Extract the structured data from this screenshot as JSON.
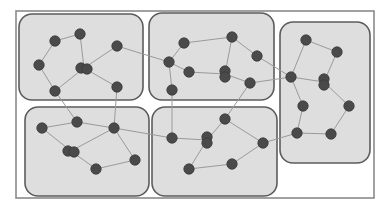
{
  "diagram": {
    "type": "clustered-network-graph",
    "colors": {
      "background": "#ffffff",
      "frame_stroke": "#8a8a8a",
      "cluster_fill": "#dedede",
      "cluster_stroke": "#5c5c5c",
      "edge": "#9a9a9a",
      "node": "#4a4a4a"
    },
    "frame": {
      "x": 16,
      "y": 11,
      "w": 358,
      "h": 187
    },
    "clusters": [
      {
        "id": "top-left",
        "x": 19,
        "y": 14,
        "w": 124,
        "h": 86,
        "r": 13
      },
      {
        "id": "top-middle",
        "x": 149,
        "y": 13,
        "w": 125,
        "h": 87,
        "r": 13
      },
      {
        "id": "right",
        "x": 280,
        "y": 22,
        "w": 90,
        "h": 141,
        "r": 13
      },
      {
        "id": "bottom-left",
        "x": 25,
        "y": 107,
        "w": 124,
        "h": 89,
        "r": 13
      },
      {
        "id": "bottom-middle",
        "x": 152,
        "y": 107,
        "w": 125,
        "h": 89,
        "r": 13
      }
    ],
    "nodes": [
      {
        "id": "A",
        "cluster": "top-left",
        "x": 55,
        "y": 41,
        "shape": "circle"
      },
      {
        "id": "B",
        "cluster": "top-left",
        "x": 80,
        "y": 34,
        "shape": "circle"
      },
      {
        "id": "C",
        "cluster": "top-left",
        "x": 39,
        "y": 65,
        "shape": "circle"
      },
      {
        "id": "D",
        "cluster": "top-left",
        "x": 84,
        "y": 68,
        "shape": "double-h"
      },
      {
        "id": "E",
        "cluster": "top-left",
        "x": 117,
        "y": 46,
        "shape": "circle"
      },
      {
        "id": "F",
        "cluster": "top-left",
        "x": 55,
        "y": 91,
        "shape": "circle"
      },
      {
        "id": "G",
        "cluster": "top-left",
        "x": 117,
        "y": 87,
        "shape": "circle"
      },
      {
        "id": "H",
        "cluster": "top-middle",
        "x": 169,
        "y": 62,
        "shape": "circle"
      },
      {
        "id": "I",
        "cluster": "top-middle",
        "x": 184,
        "y": 43,
        "shape": "circle"
      },
      {
        "id": "J",
        "cluster": "top-middle",
        "x": 232,
        "y": 37,
        "shape": "circle"
      },
      {
        "id": "K",
        "cluster": "top-middle",
        "x": 257,
        "y": 56,
        "shape": "circle"
      },
      {
        "id": "L",
        "cluster": "top-middle",
        "x": 189,
        "y": 72,
        "shape": "circle"
      },
      {
        "id": "M",
        "cluster": "top-middle",
        "x": 225,
        "y": 74,
        "shape": "double-v"
      },
      {
        "id": "N",
        "cluster": "top-middle",
        "x": 250,
        "y": 83,
        "shape": "circle"
      },
      {
        "id": "O",
        "cluster": "top-middle",
        "x": 172,
        "y": 90,
        "shape": "circle"
      },
      {
        "id": "P",
        "cluster": "right",
        "x": 306,
        "y": 40,
        "shape": "circle"
      },
      {
        "id": "Q",
        "cluster": "right",
        "x": 337,
        "y": 52,
        "shape": "circle"
      },
      {
        "id": "R",
        "cluster": "right",
        "x": 291,
        "y": 77,
        "shape": "circle"
      },
      {
        "id": "S",
        "cluster": "right",
        "x": 324,
        "y": 82,
        "shape": "double-v"
      },
      {
        "id": "T",
        "cluster": "right",
        "x": 303,
        "y": 106,
        "shape": "circle"
      },
      {
        "id": "U",
        "cluster": "right",
        "x": 349,
        "y": 106,
        "shape": "circle"
      },
      {
        "id": "V",
        "cluster": "right",
        "x": 297,
        "y": 133,
        "shape": "circle"
      },
      {
        "id": "W",
        "cluster": "right",
        "x": 331,
        "y": 134,
        "shape": "circle"
      },
      {
        "id": "a",
        "cluster": "bottom-left",
        "x": 42,
        "y": 128,
        "shape": "circle"
      },
      {
        "id": "b",
        "cluster": "bottom-left",
        "x": 77,
        "y": 122,
        "shape": "circle"
      },
      {
        "id": "c",
        "cluster": "bottom-left",
        "x": 114,
        "y": 128,
        "shape": "circle"
      },
      {
        "id": "d",
        "cluster": "bottom-left",
        "x": 71,
        "y": 151,
        "shape": "double-h"
      },
      {
        "id": "e",
        "cluster": "bottom-left",
        "x": 135,
        "y": 160,
        "shape": "circle"
      },
      {
        "id": "f",
        "cluster": "bottom-left",
        "x": 96,
        "y": 169,
        "shape": "circle"
      },
      {
        "id": "g",
        "cluster": "bottom-middle",
        "x": 172,
        "y": 138,
        "shape": "circle"
      },
      {
        "id": "h",
        "cluster": "bottom-middle",
        "x": 207,
        "y": 140,
        "shape": "double-v"
      },
      {
        "id": "i",
        "cluster": "bottom-middle",
        "x": 225,
        "y": 119,
        "shape": "circle"
      },
      {
        "id": "j",
        "cluster": "bottom-middle",
        "x": 263,
        "y": 143,
        "shape": "circle"
      },
      {
        "id": "k",
        "cluster": "bottom-middle",
        "x": 232,
        "y": 164,
        "shape": "circle"
      },
      {
        "id": "l",
        "cluster": "bottom-middle",
        "x": 189,
        "y": 169,
        "shape": "circle"
      }
    ],
    "edges": [
      [
        "A",
        "B"
      ],
      [
        "A",
        "C"
      ],
      [
        "B",
        "D"
      ],
      [
        "C",
        "F"
      ],
      [
        "D",
        "E"
      ],
      [
        "D",
        "F"
      ],
      [
        "D",
        "G"
      ],
      [
        "E",
        "H"
      ],
      [
        "H",
        "I"
      ],
      [
        "I",
        "J"
      ],
      [
        "J",
        "M"
      ],
      [
        "H",
        "L"
      ],
      [
        "H",
        "O"
      ],
      [
        "L",
        "M"
      ],
      [
        "M",
        "N"
      ],
      [
        "J",
        "K"
      ],
      [
        "K",
        "R"
      ],
      [
        "P",
        "R"
      ],
      [
        "P",
        "Q"
      ],
      [
        "Q",
        "S"
      ],
      [
        "R",
        "S"
      ],
      [
        "R",
        "T"
      ],
      [
        "S",
        "U"
      ],
      [
        "T",
        "V"
      ],
      [
        "U",
        "W"
      ],
      [
        "V",
        "W"
      ],
      [
        "N",
        "R"
      ],
      [
        "a",
        "b"
      ],
      [
        "a",
        "d"
      ],
      [
        "b",
        "c"
      ],
      [
        "c",
        "d"
      ],
      [
        "d",
        "f"
      ],
      [
        "f",
        "e"
      ],
      [
        "c",
        "e"
      ],
      [
        "F",
        "b"
      ],
      [
        "G",
        "c"
      ],
      [
        "c",
        "g"
      ],
      [
        "O",
        "g"
      ],
      [
        "g",
        "h"
      ],
      [
        "h",
        "i"
      ],
      [
        "h",
        "l"
      ],
      [
        "l",
        "k"
      ],
      [
        "k",
        "j"
      ],
      [
        "i",
        "j"
      ],
      [
        "j",
        "V"
      ],
      [
        "N",
        "i"
      ]
    ]
  }
}
